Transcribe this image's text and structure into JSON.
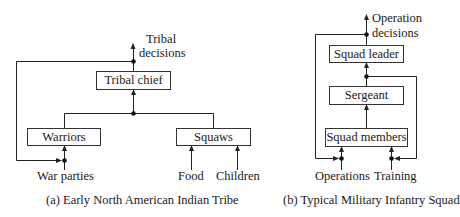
{
  "diagram_a": {
    "caption": "(a) Early North American Indian Tribe",
    "output_label_line1": "Tribal",
    "output_label_line2": "decisions",
    "nodes": {
      "top": "Tribal chief",
      "left": "Warriors",
      "right": "Squaws"
    },
    "inputs": {
      "war_parties": "War parties",
      "food": "Food",
      "children": "Children"
    }
  },
  "diagram_b": {
    "caption": "(b) Typical Military Infantry Squad",
    "output_label_line1": "Operation",
    "output_label_line2": "decisions",
    "nodes": {
      "top": "Squad leader",
      "middle": "Sergeant",
      "bottom": "Squad members"
    },
    "inputs": {
      "operations": "Operations",
      "training": "Training"
    }
  },
  "colors": {
    "line": "#222222",
    "box_border": "#333333",
    "background": "#ffffff"
  }
}
